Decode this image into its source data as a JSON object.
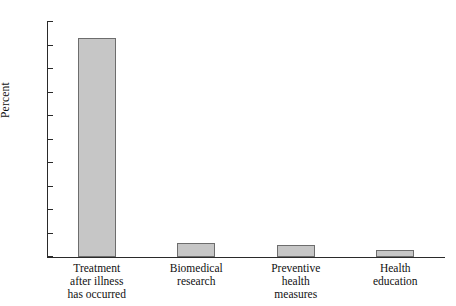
{
  "chart_data": {
    "type": "bar",
    "title": "",
    "xlabel": "",
    "ylabel": "Percent",
    "ylim": [
      0,
      100
    ],
    "yticks": [
      0,
      10,
      20,
      30,
      40,
      50,
      60,
      70,
      80,
      90,
      100
    ],
    "ytick_labels": [
      "0",
      "10",
      "20",
      "30",
      "40",
      "50",
      "60",
      "70",
      "80",
      "90",
      "100"
    ],
    "grid": false,
    "legend": false,
    "categories": [
      "Treatment after illness has occurred",
      "Biomedical research",
      "Preventive health measures",
      "Health education"
    ],
    "category_label_lines": [
      [
        "Treatment",
        "after illness",
        "has occurred"
      ],
      [
        "Biomedical",
        "research"
      ],
      [
        "Preventive",
        "health",
        "measures"
      ],
      [
        "Health",
        "education"
      ]
    ],
    "values": [
      93,
      6,
      5,
      3
    ],
    "bar_fill_color": "#c6c6c6",
    "bar_border_color": "#6d6d6d",
    "axis_color": "#2a2a2a",
    "background_color": "#ffffff"
  }
}
